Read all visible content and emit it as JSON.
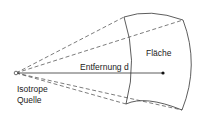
{
  "diagram": {
    "source_label_line1": "Isotrope",
    "source_label_line2": "Quelle",
    "distance_label": "Entfernung  d",
    "area_label": "Fläche"
  }
}
